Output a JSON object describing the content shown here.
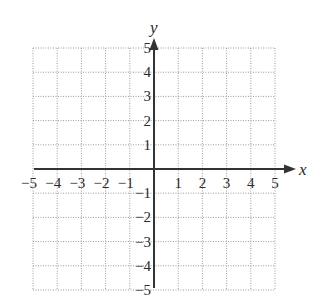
{
  "chart_data": {
    "type": "coordinate-grid",
    "title": "",
    "xlabel": "x",
    "ylabel": "y",
    "xlim": [
      -5,
      5
    ],
    "ylim": [
      -5,
      5
    ],
    "grid": true,
    "grid_style": "dotted",
    "x_ticks": [
      "−5",
      "−4",
      "−3",
      "−2",
      "−1",
      "1",
      "2",
      "3",
      "4",
      "5"
    ],
    "y_ticks": [
      "5",
      "4",
      "3",
      "2",
      "1",
      "−1",
      "−2",
      "−3",
      "−4",
      "−5"
    ],
    "series": []
  },
  "colors": {
    "axis": "#333333",
    "grid": "#9a9a9a",
    "text": "#2a2a2a"
  },
  "labels": {
    "x_axis": "x",
    "y_axis": "y"
  }
}
